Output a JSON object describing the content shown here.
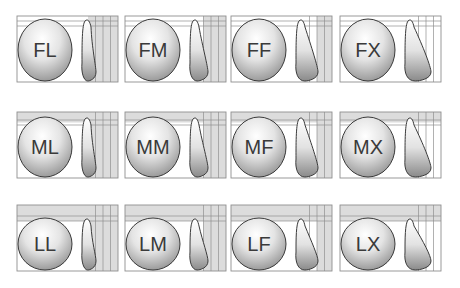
{
  "colors": {
    "frame": "#8f8f8f",
    "band": "#dcdcdc",
    "outline": "#3a3a3a",
    "label": "#3a3a3a",
    "shade_light": "#ffffff",
    "shade_dark": "#8a8a8a"
  },
  "rows": [
    {
      "height_code": "F",
      "band_rows": 0
    },
    {
      "height_code": "M",
      "band_rows": 1
    },
    {
      "height_code": "L",
      "band_rows": 2
    }
  ],
  "columns": [
    {
      "projection_code": "L",
      "band_cols": 3
    },
    {
      "projection_code": "M",
      "band_cols": 2
    },
    {
      "projection_code": "F",
      "band_cols": 1
    },
    {
      "projection_code": "X",
      "band_cols": 0
    }
  ],
  "panels": [
    {
      "label": "FL",
      "row": 0,
      "col": 0
    },
    {
      "label": "FM",
      "row": 0,
      "col": 1
    },
    {
      "label": "FF",
      "row": 0,
      "col": 2
    },
    {
      "label": "FX",
      "row": 0,
      "col": 3
    },
    {
      "label": "ML",
      "row": 1,
      "col": 0
    },
    {
      "label": "MM",
      "row": 1,
      "col": 1
    },
    {
      "label": "MF",
      "row": 1,
      "col": 2
    },
    {
      "label": "MX",
      "row": 1,
      "col": 3
    },
    {
      "label": "LL",
      "row": 2,
      "col": 0
    },
    {
      "label": "LM",
      "row": 2,
      "col": 1
    },
    {
      "label": "LF",
      "row": 2,
      "col": 2
    },
    {
      "label": "LX",
      "row": 2,
      "col": 3
    }
  ]
}
